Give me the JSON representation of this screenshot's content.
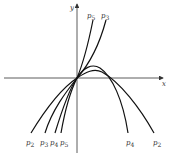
{
  "diagram": {
    "axes": {
      "x_label": "x",
      "y_label": "y"
    },
    "curves": [
      {
        "name": "p2",
        "label_main": "p",
        "label_sub": "2"
      },
      {
        "name": "p3",
        "label_main": "p",
        "label_sub": "3"
      },
      {
        "name": "p4",
        "label_main": "p",
        "label_sub": "4"
      },
      {
        "name": "p5",
        "label_main": "p",
        "label_sub": "5"
      }
    ],
    "labels": {
      "top": [
        {
          "main": "p",
          "sub": "5"
        },
        {
          "main": "p",
          "sub": "3"
        }
      ],
      "bottom_left": [
        {
          "main": "p",
          "sub": "2"
        },
        {
          "main": "p",
          "sub": "3"
        },
        {
          "main": "p",
          "sub": "4"
        },
        {
          "main": "p",
          "sub": "5"
        }
      ],
      "bottom_right": [
        {
          "main": "p",
          "sub": "4"
        },
        {
          "main": "p",
          "sub": "2"
        }
      ]
    },
    "colors": {
      "curve": "#111111",
      "axis": "#333333",
      "background": "#ffffff"
    }
  }
}
